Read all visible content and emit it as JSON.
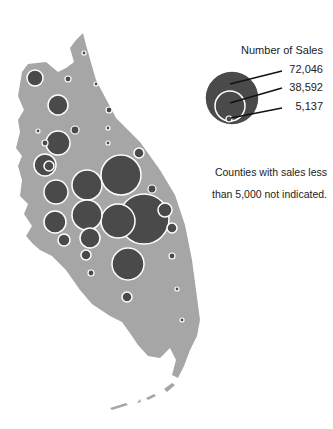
{
  "legend": {
    "title": "Number of Sales",
    "values": [
      "72,046",
      "38,592",
      "5,137"
    ],
    "note_line1": "Counties with sales less",
    "note_line2": "than 5,000 not indicated."
  },
  "colors": {
    "land": "#a6a6a6",
    "bubble": "#4a4a4a",
    "bubble_stroke": "#ffffff",
    "background": "#ffffff"
  },
  "map": {
    "region": "Florida peninsula",
    "symbol": "proportional circles",
    "bubbles": [
      {
        "x": 35,
        "y": 78,
        "r": 8
      },
      {
        "x": 68,
        "y": 79,
        "r": 3
      },
      {
        "x": 84,
        "y": 53,
        "r": 2
      },
      {
        "x": 96,
        "y": 84,
        "r": 2
      },
      {
        "x": 58,
        "y": 105,
        "r": 10
      },
      {
        "x": 109,
        "y": 110,
        "r": 3
      },
      {
        "x": 38,
        "y": 131,
        "r": 2
      },
      {
        "x": 75,
        "y": 130,
        "r": 4
      },
      {
        "x": 108,
        "y": 128,
        "r": 2
      },
      {
        "x": 108,
        "y": 143,
        "r": 2
      },
      {
        "x": 58,
        "y": 143,
        "r": 12
      },
      {
        "x": 45,
        "y": 143,
        "r": 3
      },
      {
        "x": 49,
        "y": 166,
        "r": 5
      },
      {
        "x": 139,
        "y": 153,
        "r": 5
      },
      {
        "x": 56,
        "y": 192,
        "r": 12
      },
      {
        "x": 45,
        "y": 165,
        "r": 11
      },
      {
        "x": 87,
        "y": 185,
        "r": 15
      },
      {
        "x": 121,
        "y": 175,
        "r": 20
      },
      {
        "x": 152,
        "y": 189,
        "r": 4
      },
      {
        "x": 55,
        "y": 222,
        "r": 11
      },
      {
        "x": 87,
        "y": 215,
        "r": 15
      },
      {
        "x": 118,
        "y": 221,
        "r": 17
      },
      {
        "x": 144,
        "y": 219,
        "r": 25
      },
      {
        "x": 165,
        "y": 210,
        "r": 7
      },
      {
        "x": 172,
        "y": 228,
        "r": 5
      },
      {
        "x": 64,
        "y": 240,
        "r": 6
      },
      {
        "x": 90,
        "y": 238,
        "r": 10
      },
      {
        "x": 128,
        "y": 264,
        "r": 16
      },
      {
        "x": 86,
        "y": 255,
        "r": 5
      },
      {
        "x": 91,
        "y": 273,
        "r": 3
      },
      {
        "x": 172,
        "y": 256,
        "r": 3
      },
      {
        "x": 127,
        "y": 297,
        "r": 5
      },
      {
        "x": 177,
        "y": 289,
        "r": 2
      },
      {
        "x": 182,
        "y": 320,
        "r": 2
      }
    ]
  }
}
